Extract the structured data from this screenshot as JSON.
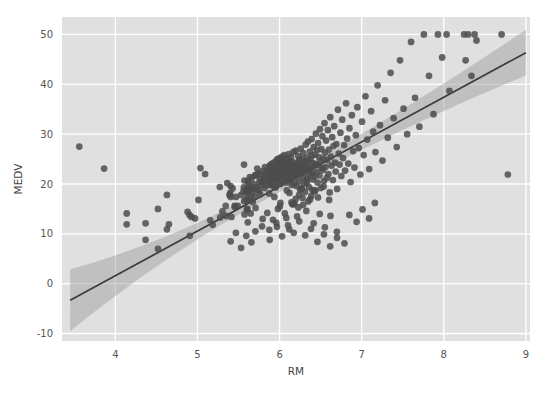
{
  "chart_data": {
    "type": "scatter",
    "title": "",
    "xlabel": "RM",
    "ylabel": "MEDV",
    "xlim": [
      3.35,
      9.05
    ],
    "ylim": [
      -11.5,
      53.5
    ],
    "xticks": [
      4,
      5,
      6,
      7,
      8,
      9
    ],
    "yticks": [
      -10,
      0,
      10,
      20,
      30,
      40,
      50
    ],
    "xtick_labels": [
      "4",
      "5",
      "6",
      "7",
      "8",
      "9"
    ],
    "ytick_labels": [
      "-10",
      "0",
      "10",
      "20",
      "30",
      "40",
      "50"
    ],
    "grid": true,
    "grid_color": "#ffffff",
    "axes_facecolor": "#e0e0e0",
    "figure_facecolor": "#ffffff",
    "legend": null,
    "point_color": "#4c4c4c",
    "point_alpha": 0.85,
    "point_size": 5.2,
    "regression": {
      "type": "linear-fit",
      "line_color": "#3a3a3a",
      "band_color": "#9a9a9a",
      "band_alpha": 0.45,
      "slope": 8.95,
      "intercept": -34.2,
      "x_start": 3.45,
      "x_end": 9.0,
      "y_start": -3.3,
      "y_end": 46.4,
      "band_halfwidth_start": 6.2,
      "band_halfwidth_mid": 1.1,
      "band_halfwidth_end": 4.6
    },
    "points": [
      [
        3.561,
        27.5
      ],
      [
        3.863,
        23.1
      ],
      [
        4.138,
        11.9
      ],
      [
        4.368,
        8.8
      ],
      [
        4.519,
        7.0
      ],
      [
        4.628,
        17.8
      ],
      [
        4.652,
        11.9
      ],
      [
        4.88,
        14.4
      ],
      [
        4.903,
        13.8
      ],
      [
        4.926,
        13.4
      ],
      [
        4.97,
        13.1
      ],
      [
        5.012,
        16.8
      ],
      [
        5.036,
        23.2
      ],
      [
        5.093,
        22.0
      ],
      [
        5.155,
        12.7
      ],
      [
        5.186,
        11.8
      ],
      [
        5.272,
        19.4
      ],
      [
        5.277,
        13.3
      ],
      [
        5.304,
        14.5
      ],
      [
        5.344,
        15.6
      ],
      [
        5.349,
        13.6
      ],
      [
        5.362,
        20.2
      ],
      [
        5.39,
        17.8
      ],
      [
        5.399,
        18.2
      ],
      [
        5.403,
        19.6
      ],
      [
        5.404,
        17.4
      ],
      [
        5.414,
        13.4
      ],
      [
        5.427,
        19.1
      ],
      [
        5.453,
        15.6
      ],
      [
        5.456,
        15.4
      ],
      [
        5.468,
        17.4
      ],
      [
        5.489,
        15.6
      ],
      [
        5.531,
        17.8
      ],
      [
        5.56,
        18.5
      ],
      [
        5.565,
        19.3
      ],
      [
        5.567,
        23.9
      ],
      [
        5.569,
        16.6
      ],
      [
        5.572,
        20.7
      ],
      [
        5.573,
        13.9
      ],
      [
        5.594,
        18.8
      ],
      [
        5.599,
        17.1
      ],
      [
        5.602,
        14.9
      ],
      [
        5.604,
        16.7
      ],
      [
        5.605,
        18.2
      ],
      [
        5.608,
        15.0
      ],
      [
        5.613,
        20.6
      ],
      [
        5.617,
        18.4
      ],
      [
        5.62,
        19.5
      ],
      [
        5.627,
        20.1
      ],
      [
        5.631,
        18.7
      ],
      [
        5.637,
        21.4
      ],
      [
        5.642,
        17.2
      ],
      [
        5.648,
        14.1
      ],
      [
        5.657,
        19.3
      ],
      [
        5.663,
        21.2
      ],
      [
        5.668,
        18.3
      ],
      [
        5.674,
        16.4
      ],
      [
        5.682,
        20.0
      ],
      [
        5.688,
        19.0
      ],
      [
        5.693,
        17.5
      ],
      [
        5.701,
        21.8
      ],
      [
        5.708,
        15.2
      ],
      [
        5.713,
        21.7
      ],
      [
        5.72,
        19.4
      ],
      [
        5.727,
        23.1
      ],
      [
        5.731,
        18.9
      ],
      [
        5.741,
        22.2
      ],
      [
        5.746,
        18.6
      ],
      [
        5.752,
        20.3
      ],
      [
        5.759,
        21.0
      ],
      [
        5.764,
        17.9
      ],
      [
        5.772,
        21.9
      ],
      [
        5.783,
        20.4
      ],
      [
        5.786,
        19.8
      ],
      [
        5.794,
        22.6
      ],
      [
        5.803,
        20.9
      ],
      [
        5.813,
        19.2
      ],
      [
        5.818,
        21.4
      ],
      [
        5.822,
        23.4
      ],
      [
        5.834,
        20.5
      ],
      [
        5.841,
        22.3
      ],
      [
        5.85,
        19.7
      ],
      [
        5.856,
        21.6
      ],
      [
        5.861,
        22.9
      ],
      [
        5.869,
        20.8
      ],
      [
        5.874,
        18.1
      ],
      [
        5.88,
        23.7
      ],
      [
        5.885,
        21.2
      ],
      [
        5.888,
        19.9
      ],
      [
        5.891,
        22.1
      ],
      [
        5.895,
        20.6
      ],
      [
        5.898,
        22.8
      ],
      [
        5.9,
        24.0
      ],
      [
        5.905,
        21.3
      ],
      [
        5.91,
        20.1
      ],
      [
        5.913,
        23.5
      ],
      [
        5.918,
        22.4
      ],
      [
        5.924,
        19.5
      ],
      [
        5.926,
        21.8
      ],
      [
        5.929,
        24.3
      ],
      [
        5.933,
        20.7
      ],
      [
        5.935,
        22.7
      ],
      [
        5.942,
        23.0
      ],
      [
        5.949,
        21.5
      ],
      [
        5.951,
        19.3
      ],
      [
        5.957,
        24.6
      ],
      [
        5.96,
        22.5
      ],
      [
        5.963,
        20.9
      ],
      [
        5.966,
        23.3
      ],
      [
        5.97,
        21.1
      ],
      [
        5.973,
        25.0
      ],
      [
        5.976,
        22.0
      ],
      [
        5.981,
        23.8
      ],
      [
        5.983,
        20.4
      ],
      [
        5.987,
        24.8
      ],
      [
        5.99,
        22.6
      ],
      [
        5.994,
        21.4
      ],
      [
        5.998,
        23.6
      ],
      [
        6.003,
        25.2
      ],
      [
        6.006,
        22.2
      ],
      [
        6.01,
        20.0
      ],
      [
        6.015,
        24.1
      ],
      [
        6.019,
        22.9
      ],
      [
        6.023,
        21.7
      ],
      [
        6.027,
        23.2
      ],
      [
        6.03,
        25.5
      ],
      [
        6.035,
        22.4
      ],
      [
        6.04,
        20.6
      ],
      [
        6.044,
        24.4
      ],
      [
        6.047,
        23.1
      ],
      [
        6.051,
        21.9
      ],
      [
        6.054,
        22.7
      ],
      [
        6.059,
        25.8
      ],
      [
        6.063,
        23.4
      ],
      [
        6.067,
        21.2
      ],
      [
        6.07,
        24.9
      ],
      [
        6.075,
        22.8
      ],
      [
        6.079,
        20.3
      ],
      [
        6.083,
        23.9
      ],
      [
        6.086,
        22.1
      ],
      [
        6.09,
        25.1
      ],
      [
        6.095,
        23.7
      ],
      [
        6.098,
        21.6
      ],
      [
        6.103,
        24.2
      ],
      [
        6.107,
        22.3
      ],
      [
        6.112,
        26.0
      ],
      [
        6.115,
        23.5
      ],
      [
        6.119,
        21.0
      ],
      [
        6.122,
        24.7
      ],
      [
        6.127,
        22.9
      ],
      [
        6.13,
        20.8
      ],
      [
        6.135,
        23.0
      ],
      [
        6.14,
        25.4
      ],
      [
        6.144,
        22.6
      ],
      [
        6.148,
        19.8
      ],
      [
        6.152,
        24.5
      ],
      [
        6.156,
        23.3
      ],
      [
        6.16,
        21.5
      ],
      [
        6.164,
        22.2
      ],
      [
        6.167,
        26.4
      ],
      [
        6.172,
        23.8
      ],
      [
        6.176,
        20.1
      ],
      [
        6.18,
        24.0
      ],
      [
        6.185,
        22.5
      ],
      [
        6.189,
        21.3
      ],
      [
        6.193,
        23.6
      ],
      [
        6.198,
        26.7
      ],
      [
        6.202,
        22.0
      ],
      [
        6.206,
        19.6
      ],
      [
        6.211,
        24.3
      ],
      [
        6.215,
        23.2
      ],
      [
        6.219,
        21.8
      ],
      [
        6.223,
        22.4
      ],
      [
        6.228,
        25.6
      ],
      [
        6.232,
        23.9
      ],
      [
        6.236,
        20.5
      ],
      [
        6.24,
        24.8
      ],
      [
        6.245,
        22.7
      ],
      [
        6.249,
        18.9
      ],
      [
        6.253,
        23.4
      ],
      [
        6.258,
        27.1
      ],
      [
        6.262,
        22.1
      ],
      [
        6.266,
        19.1
      ],
      [
        6.271,
        25.0
      ],
      [
        6.275,
        23.1
      ],
      [
        6.279,
        21.4
      ],
      [
        6.284,
        22.8
      ],
      [
        6.288,
        26.2
      ],
      [
        6.292,
        24.1
      ],
      [
        6.297,
        20.2
      ],
      [
        6.301,
        23.7
      ],
      [
        6.305,
        22.3
      ],
      [
        6.31,
        18.4
      ],
      [
        6.314,
        24.6
      ],
      [
        6.318,
        27.9
      ],
      [
        6.323,
        22.9
      ],
      [
        6.327,
        20.7
      ],
      [
        6.331,
        23.5
      ],
      [
        6.336,
        25.3
      ],
      [
        6.34,
        21.1
      ],
      [
        6.345,
        28.5
      ],
      [
        6.349,
        24.4
      ],
      [
        6.354,
        22.6
      ],
      [
        6.358,
        19.4
      ],
      [
        6.363,
        23.0
      ],
      [
        6.368,
        26.5
      ],
      [
        6.372,
        21.9
      ],
      [
        6.377,
        24.9
      ],
      [
        6.381,
        23.3
      ],
      [
        6.386,
        17.6
      ],
      [
        6.391,
        29.0
      ],
      [
        6.395,
        25.7
      ],
      [
        6.4,
        22.2
      ],
      [
        6.405,
        20.9
      ],
      [
        6.41,
        24.2
      ],
      [
        6.415,
        27.4
      ],
      [
        6.42,
        23.6
      ],
      [
        6.426,
        21.5
      ],
      [
        6.431,
        25.9
      ],
      [
        6.436,
        18.7
      ],
      [
        6.442,
        30.1
      ],
      [
        6.447,
        24.0
      ],
      [
        6.452,
        22.4
      ],
      [
        6.458,
        26.8
      ],
      [
        6.463,
        20.3
      ],
      [
        6.469,
        28.2
      ],
      [
        6.474,
        23.8
      ],
      [
        6.48,
        25.4
      ],
      [
        6.486,
        21.7
      ],
      [
        6.492,
        31.0
      ],
      [
        6.497,
        24.5
      ],
      [
        6.503,
        19.2
      ],
      [
        6.509,
        27.0
      ],
      [
        6.515,
        23.2
      ],
      [
        6.521,
        29.6
      ],
      [
        6.527,
        22.8
      ],
      [
        6.534,
        25.1
      ],
      [
        6.54,
        20.6
      ],
      [
        6.547,
        32.2
      ],
      [
        6.553,
        26.3
      ],
      [
        6.56,
        23.4
      ],
      [
        6.567,
        28.7
      ],
      [
        6.574,
        21.2
      ],
      [
        6.581,
        24.8
      ],
      [
        6.588,
        30.8
      ],
      [
        6.595,
        22.0
      ],
      [
        6.602,
        26.9
      ],
      [
        6.61,
        18.3
      ],
      [
        6.617,
        33.4
      ],
      [
        6.625,
        25.5
      ],
      [
        6.633,
        23.7
      ],
      [
        6.641,
        29.4
      ],
      [
        6.649,
        20.8
      ],
      [
        6.657,
        27.6
      ],
      [
        6.665,
        31.6
      ],
      [
        6.674,
        24.3
      ],
      [
        6.683,
        22.5
      ],
      [
        6.692,
        28.0
      ],
      [
        6.701,
        19.0
      ],
      [
        6.711,
        34.9
      ],
      [
        6.721,
        26.1
      ],
      [
        6.731,
        23.9
      ],
      [
        6.741,
        30.3
      ],
      [
        6.752,
        21.6
      ],
      [
        6.763,
        32.9
      ],
      [
        6.774,
        25.2
      ],
      [
        6.786,
        27.8
      ],
      [
        6.798,
        22.7
      ],
      [
        6.81,
        36.2
      ],
      [
        6.823,
        29.1
      ],
      [
        6.837,
        24.1
      ],
      [
        6.851,
        31.2
      ],
      [
        6.865,
        20.4
      ],
      [
        6.88,
        33.8
      ],
      [
        6.896,
        26.6
      ],
      [
        6.912,
        23.3
      ],
      [
        6.929,
        29.8
      ],
      [
        6.947,
        35.4
      ],
      [
        6.965,
        27.2
      ],
      [
        6.984,
        21.9
      ],
      [
        7.004,
        32.5
      ],
      [
        7.024,
        25.8
      ],
      [
        7.046,
        37.6
      ],
      [
        7.068,
        28.9
      ],
      [
        7.091,
        23.0
      ],
      [
        7.115,
        34.6
      ],
      [
        7.14,
        30.5
      ],
      [
        7.167,
        26.4
      ],
      [
        7.194,
        39.8
      ],
      [
        7.223,
        31.8
      ],
      [
        7.253,
        24.7
      ],
      [
        7.285,
        36.8
      ],
      [
        7.318,
        29.3
      ],
      [
        7.352,
        42.3
      ],
      [
        7.389,
        33.2
      ],
      [
        7.427,
        27.4
      ],
      [
        7.467,
        44.8
      ],
      [
        7.51,
        35.1
      ],
      [
        7.554,
        30.0
      ],
      [
        7.601,
        48.5
      ],
      [
        7.65,
        37.3
      ],
      [
        7.703,
        31.5
      ],
      [
        7.758,
        50.0
      ],
      [
        7.82,
        41.7
      ],
      [
        7.875,
        34.0
      ],
      [
        7.929,
        50.0
      ],
      [
        7.98,
        45.4
      ],
      [
        8.034,
        50.0
      ],
      [
        8.069,
        38.7
      ],
      [
        8.247,
        50.0
      ],
      [
        8.266,
        44.8
      ],
      [
        8.297,
        50.0
      ],
      [
        8.337,
        41.7
      ],
      [
        8.375,
        50.0
      ],
      [
        8.398,
        48.8
      ],
      [
        8.704,
        50.0
      ],
      [
        8.78,
        21.9
      ],
      [
        6.182,
        16.1
      ],
      [
        6.229,
        15.3
      ],
      [
        6.279,
        17.2
      ],
      [
        6.326,
        14.6
      ],
      [
        6.372,
        16.9
      ],
      [
        5.98,
        15.0
      ],
      [
        6.064,
        14.1
      ],
      [
        6.145,
        16.3
      ],
      [
        6.213,
        13.5
      ],
      [
        6.286,
        15.8
      ],
      [
        5.85,
        14.2
      ],
      [
        5.92,
        12.8
      ],
      [
        6.003,
        15.5
      ],
      [
        6.082,
        13.2
      ],
      [
        6.158,
        16.0
      ],
      [
        6.415,
        12.1
      ],
      [
        6.489,
        14.0
      ],
      [
        6.552,
        11.3
      ],
      [
        6.62,
        13.6
      ],
      [
        6.698,
        10.4
      ],
      [
        6.103,
        11.7
      ],
      [
        6.172,
        10.2
      ],
      [
        6.24,
        12.5
      ],
      [
        6.312,
        9.7
      ],
      [
        6.383,
        11.0
      ],
      [
        5.786,
        11.5
      ],
      [
        5.875,
        10.8
      ],
      [
        5.961,
        12.2
      ],
      [
        6.03,
        9.5
      ],
      [
        6.118,
        10.9
      ],
      [
        5.613,
        12.3
      ],
      [
        5.705,
        10.5
      ],
      [
        5.794,
        13.0
      ],
      [
        5.88,
        8.8
      ],
      [
        5.968,
        11.4
      ],
      [
        6.461,
        8.4
      ],
      [
        6.54,
        9.9
      ],
      [
        6.616,
        7.5
      ],
      [
        6.7,
        9.2
      ],
      [
        6.79,
        8.1
      ],
      [
        6.85,
        13.8
      ],
      [
        6.938,
        12.4
      ],
      [
        7.01,
        14.9
      ],
      [
        7.09,
        13.1
      ],
      [
        7.16,
        16.2
      ],
      [
        5.404,
        8.5
      ],
      [
        5.468,
        10.2
      ],
      [
        5.531,
        7.2
      ],
      [
        5.594,
        9.6
      ],
      [
        5.657,
        8.3
      ],
      [
        4.138,
        14.1
      ],
      [
        4.368,
        12.1
      ],
      [
        4.519,
        15.0
      ],
      [
        4.628,
        10.9
      ],
      [
        4.906,
        9.6
      ],
      [
        6.333,
        20.1
      ],
      [
        6.401,
        18.8
      ],
      [
        6.468,
        17.3
      ],
      [
        6.537,
        19.5
      ],
      [
        6.604,
        16.8
      ],
      [
        6.12,
        18.2
      ],
      [
        6.196,
        17.0
      ],
      [
        6.272,
        19.1
      ],
      [
        6.348,
        16.5
      ],
      [
        6.424,
        18.5
      ],
      [
        5.936,
        17.4
      ],
      [
        6.01,
        16.2
      ],
      [
        6.088,
        18.7
      ],
      [
        6.164,
        15.9
      ],
      [
        6.238,
        17.8
      ]
    ]
  }
}
